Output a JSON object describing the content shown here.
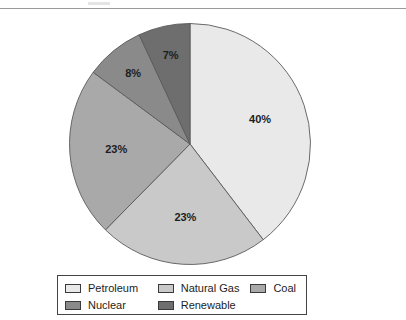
{
  "page": {
    "background_color": "#ffffff",
    "width": 406,
    "height": 320,
    "rule_color": "#9a9a9a"
  },
  "chart_data": {
    "type": "pie",
    "title": "",
    "subtitle": "",
    "xlabel": "",
    "ylabel": "",
    "grid": false,
    "legend_position": "bottom",
    "start_angle_deg": 0,
    "direction": "clockwise",
    "units": "percent",
    "categories": [
      "Petroleum",
      "Natural Gas",
      "Coal",
      "Nuclear",
      "Renewable"
    ],
    "values": [
      40,
      23,
      23,
      8,
      7
    ],
    "data_labels": [
      "40%",
      "23%",
      "23%",
      "8%",
      "7%"
    ],
    "colors": [
      "#e9e9e9",
      "#c9c9c9",
      "#a9a9a9",
      "#8a8a8a",
      "#6e6e6e"
    ],
    "slices": [
      {
        "label": "Petroleum",
        "value": 40,
        "display": "40%",
        "color": "#e9e9e9"
      },
      {
        "label": "Natural Gas",
        "value": 23,
        "display": "23%",
        "color": "#c9c9c9"
      },
      {
        "label": "Coal",
        "value": 23,
        "display": "23%",
        "color": "#a9a9a9"
      },
      {
        "label": "Nuclear",
        "value": 8,
        "display": "8%",
        "color": "#8a8a8a"
      },
      {
        "label": "Renewable",
        "value": 7,
        "display": "7%",
        "color": "#6e6e6e"
      }
    ],
    "slice_outline_color": "#5a5a5a",
    "label_text_color": "#1d1d1d"
  },
  "legend": {
    "border_color": "#444444",
    "rows": [
      [
        {
          "label": "Petroleum",
          "color": "#e9e9e9"
        },
        {
          "label": "Natural Gas",
          "color": "#c9c9c9"
        },
        {
          "label": "Coal",
          "color": "#a9a9a9"
        }
      ],
      [
        {
          "label": "Nuclear",
          "color": "#8a8a8a"
        },
        {
          "label": "Renewable",
          "color": "#6e6e6e"
        }
      ]
    ]
  }
}
